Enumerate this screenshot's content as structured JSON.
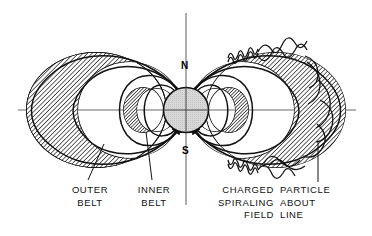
{
  "diagram": {
    "type": "magnetosphere-cross-section",
    "background_color": "#ffffff",
    "line_color": "#111111",
    "earth_fill": "#d4d4d4",
    "belt_fill": "#9a9a9a",
    "axis_color": "#555555"
  },
  "poles": {
    "north": "N",
    "south": "S"
  },
  "labels": {
    "outer_belt": "OUTER\nBELT",
    "inner_belt": "INNER\nBELT",
    "particle_left": "CHARGED\nSPIRALING\nFIELD",
    "particle_right": "PARTICLE\nABOUT\nLINE"
  },
  "elements": {
    "earth": "earth-sphere",
    "inner_belt_left": "inner-belt-crescent-left",
    "inner_belt_right": "inner-belt-crescent-right",
    "outer_belt_left": "outer-belt-crescent-left",
    "outer_belt_right": "outer-belt-crescent-right",
    "field_lines": "magnetic-field-lines",
    "spiral_path": "charged-particle-helix",
    "horizontal_axis": "equatorial-axis",
    "vertical_axis": "magnetic-axis"
  }
}
